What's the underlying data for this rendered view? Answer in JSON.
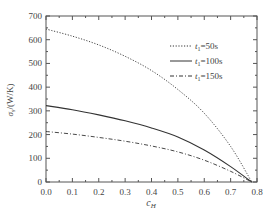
{
  "chart_data": {
    "type": "line",
    "title": "",
    "xlabel": "c_H",
    "ylabel": "σ_s/(W/K)",
    "xlim": [
      0.0,
      0.8
    ],
    "ylim": [
      0,
      700
    ],
    "xticks": [
      "0.0",
      "0.1",
      "0.2",
      "0.3",
      "0.4",
      "0.5",
      "0.6",
      "0.7",
      "0.8"
    ],
    "yticks": [
      "0",
      "100",
      "200",
      "300",
      "400",
      "500",
      "600",
      "700"
    ],
    "grid": false,
    "legend_position": "upper right",
    "x": [
      0.0,
      0.1,
      0.2,
      0.3,
      0.4,
      0.5,
      0.6,
      0.7,
      0.78
    ],
    "series": [
      {
        "name": "t1=50s",
        "label_var": "t",
        "label_sub": "1",
        "label_val": "=50s",
        "style": "dotted",
        "values": [
          645,
          615,
          578,
          530,
          470,
          390,
          290,
          150,
          0
        ]
      },
      {
        "name": "t1=100s",
        "label_var": "t",
        "label_sub": "1",
        "label_val": "=100s",
        "style": "solid",
        "values": [
          322,
          305,
          283,
          258,
          228,
          190,
          135,
          65,
          0
        ]
      },
      {
        "name": "t1=150s",
        "label_var": "t",
        "label_sub": "1",
        "label_val": "=150s",
        "style": "dashdot",
        "values": [
          213,
          202,
          188,
          172,
          152,
          127,
          92,
          45,
          0
        ]
      }
    ]
  }
}
